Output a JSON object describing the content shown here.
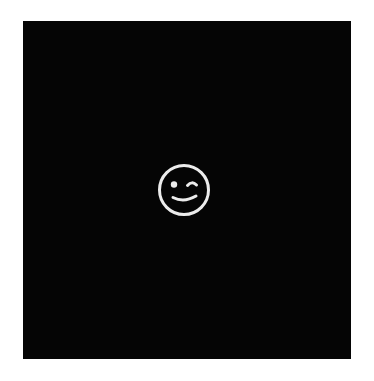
{
  "canvas": {
    "background": "#ffffff",
    "width": 374,
    "height": 381
  },
  "tile": {
    "background": "#050505",
    "x": 23,
    "y": 21,
    "width": 328,
    "height": 338
  },
  "icon": {
    "name": "winking-face-icon",
    "label": "Winking face",
    "color": "#ececec",
    "center_x": 184,
    "center_y": 190,
    "diameter": 52
  }
}
